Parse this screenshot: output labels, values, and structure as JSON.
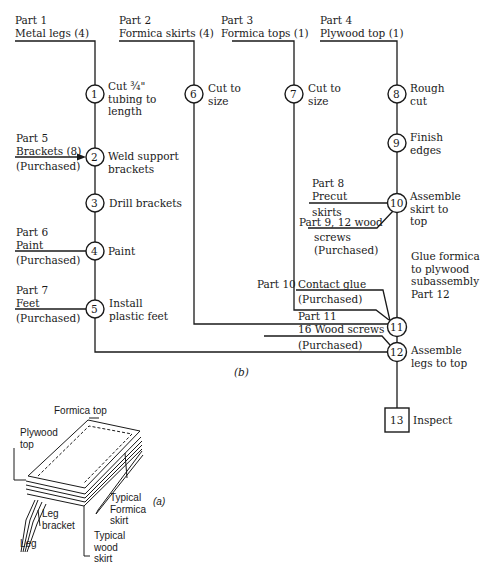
{
  "diagram": {
    "title_b": "(b)",
    "title_a": "(a)",
    "parts_top": [
      {
        "id": "part-1",
        "line1": "Part 1",
        "line2": "Metal legs (4)"
      },
      {
        "id": "part-2",
        "line1": "Part 2",
        "line2": "Formica skirts (4)"
      },
      {
        "id": "part-3",
        "line1": "Part 3",
        "line2": "Formica tops (1)"
      },
      {
        "id": "part-4",
        "line1": "Part 4",
        "line2": "Plywood top (1)"
      }
    ],
    "side_parts": {
      "part5": {
        "line1": "Part 5",
        "line2": "Brackets (8)",
        "line3": "(Purchased)"
      },
      "part6": {
        "line1": "Part 6",
        "line2": "Paint",
        "line3": "(Purchased)"
      },
      "part7": {
        "line1": "Part 7",
        "line2": "Feet",
        "line3": "(Purchased)"
      },
      "part8": {
        "line1": "Part 8",
        "line2": "Precut",
        "line3": "skirts"
      },
      "part9": {
        "line1": "Part 9, 12 wood",
        "line2": "screws",
        "line3": "(Purchased)"
      },
      "part10": {
        "line1": "Part 10",
        "line2": "Contact glue",
        "line3": "(Purchased)"
      },
      "part11": {
        "line1": "Part 11",
        "line2": "16 Wood screws",
        "line3": "(Purchased)"
      }
    },
    "operations": [
      {
        "num": "1",
        "l1": "Cut ¾\"",
        "l2": "tubing to",
        "l3": "length"
      },
      {
        "num": "2",
        "l1": "Weld support",
        "l2": "brackets"
      },
      {
        "num": "3",
        "l1": "Drill brackets"
      },
      {
        "num": "4",
        "l1": "Paint"
      },
      {
        "num": "5",
        "l1": "Install",
        "l2": "plastic feet"
      },
      {
        "num": "6",
        "l1": "Cut to",
        "l2": "size"
      },
      {
        "num": "7",
        "l1": "Cut to",
        "l2": "size"
      },
      {
        "num": "8",
        "l1": "Rough",
        "l2": "cut"
      },
      {
        "num": "9",
        "l1": "Finish",
        "l2": "edges"
      },
      {
        "num": "10",
        "l1": "Assemble",
        "l2": "skirt to",
        "l3": "top"
      },
      {
        "num": "11",
        "l1": "Glue formica",
        "l2": "to plywood",
        "l3": "subassembly",
        "l4": "Part 12"
      },
      {
        "num": "12",
        "l1": "Assemble",
        "l2": "legs to top"
      }
    ],
    "inspection": {
      "num": "13",
      "label": "Inspect"
    },
    "illustration": {
      "formica_top": "Formica top",
      "plywood_top_1": "Plywood",
      "plywood_top_2": "top",
      "leg_bracket_1": "Leg",
      "leg_bracket_2": "bracket",
      "leg": "Leg",
      "formica_skirt_1": "Typical",
      "formica_skirt_2": "Formica",
      "formica_skirt_3": "skirt",
      "wood_skirt_1": "Typical",
      "wood_skirt_2": "wood",
      "wood_skirt_3": "skirt"
    }
  }
}
